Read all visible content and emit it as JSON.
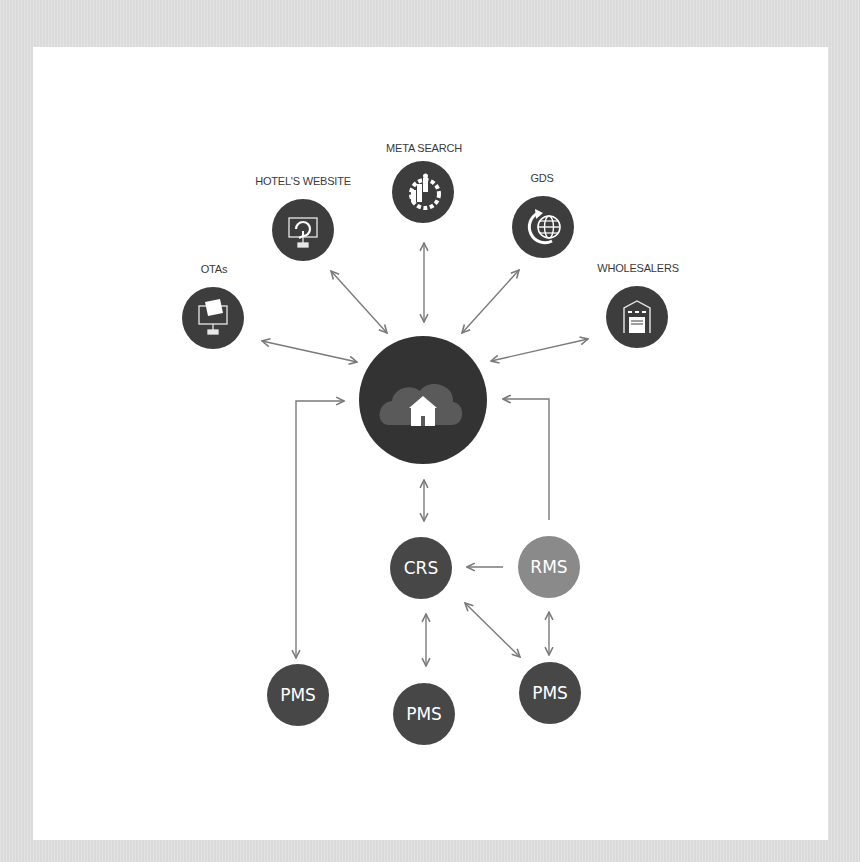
{
  "colors": {
    "background": "#dedede",
    "panel": "#ffffff",
    "hub": "#333333",
    "channel_node": "#3d3d3d",
    "system_node": "#474747",
    "rms_node": "#8a8a8a",
    "connector": "#7a7a7a",
    "hub_cloud": "#5a5a5a"
  },
  "hub": {
    "name": "Cloud hotel hub",
    "icon": "cloud-house-icon"
  },
  "channels": [
    {
      "id": "otas",
      "label": "OTAs",
      "icon": "laptop-ticket-icon"
    },
    {
      "id": "hotels-website",
      "label": "HOTEL'S WEBSITE",
      "icon": "monitor-refresh-icon"
    },
    {
      "id": "meta-search",
      "label": "META SEARCH",
      "icon": "gear-chart-icon"
    },
    {
      "id": "gds",
      "label": "GDS",
      "icon": "globe-refresh-icon"
    },
    {
      "id": "wholesalers",
      "label": "WHOLESALERS",
      "icon": "warehouse-icon"
    }
  ],
  "systems": {
    "crs": {
      "label": "CRS"
    },
    "rms": {
      "label": "RMS"
    },
    "pms_left": {
      "label": "PMS"
    },
    "pms_middle": {
      "label": "PMS"
    },
    "pms_right": {
      "label": "PMS"
    }
  },
  "connections": [
    {
      "from": "otas",
      "to": "hub",
      "direction": "both"
    },
    {
      "from": "hotels-website",
      "to": "hub",
      "direction": "both"
    },
    {
      "from": "meta-search",
      "to": "hub",
      "direction": "both"
    },
    {
      "from": "gds",
      "to": "hub",
      "direction": "both"
    },
    {
      "from": "wholesalers",
      "to": "hub",
      "direction": "both"
    },
    {
      "from": "hub",
      "to": "crs",
      "direction": "both"
    },
    {
      "from": "pms_left",
      "to": "hub",
      "direction": "both"
    },
    {
      "from": "rms",
      "to": "hub",
      "direction": "forward"
    },
    {
      "from": "rms",
      "to": "crs",
      "direction": "forward"
    },
    {
      "from": "crs",
      "to": "pms_middle",
      "direction": "both"
    },
    {
      "from": "crs",
      "to": "pms_right",
      "direction": "both"
    },
    {
      "from": "rms",
      "to": "pms_right",
      "direction": "both"
    }
  ]
}
